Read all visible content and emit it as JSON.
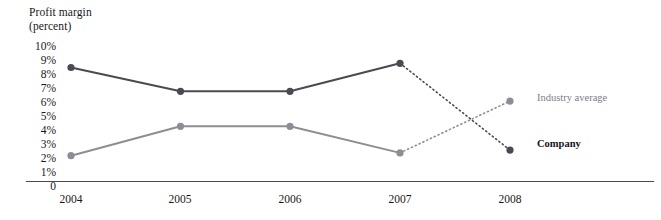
{
  "chart_data": {
    "type": "line",
    "title_lines": [
      "Profit margin",
      "(percent)"
    ],
    "xlabel": "",
    "ylabel": "Profit margin (percent)",
    "ylim": [
      0,
      10
    ],
    "grid": false,
    "legend_position": "right",
    "categories": [
      "2004",
      "2005",
      "2006",
      "2007",
      "2008"
    ],
    "y_ticks": [
      "10%",
      "9%",
      "8%",
      "7%",
      "6%",
      "5%",
      "4%",
      "3%",
      "2%",
      "1%",
      "0"
    ],
    "y_tick_values": [
      10,
      9,
      8,
      7,
      6,
      5,
      4,
      3,
      2,
      1,
      0
    ],
    "series": [
      {
        "name": "Company",
        "color": "#4a4a52",
        "values": [
          8.5,
          6.8,
          6.8,
          8.8,
          2.6
        ],
        "dashed_from_index": 3,
        "note": "solid 2004-2007, dotted projection 2007-2008"
      },
      {
        "name": "Industry average",
        "color": "#8d8d95",
        "values": [
          2.2,
          4.3,
          4.3,
          2.4,
          6.1
        ],
        "dashed_from_index": 3,
        "note": "solid 2004-2007, dotted projection 2007-2008"
      }
    ]
  },
  "legend": {
    "industry_label": "Industry average",
    "company_label": "Company"
  },
  "colors": {
    "company": "#4a4a52",
    "industry": "#8d8d95",
    "axis": "#4a4a52",
    "text": "#181818"
  }
}
